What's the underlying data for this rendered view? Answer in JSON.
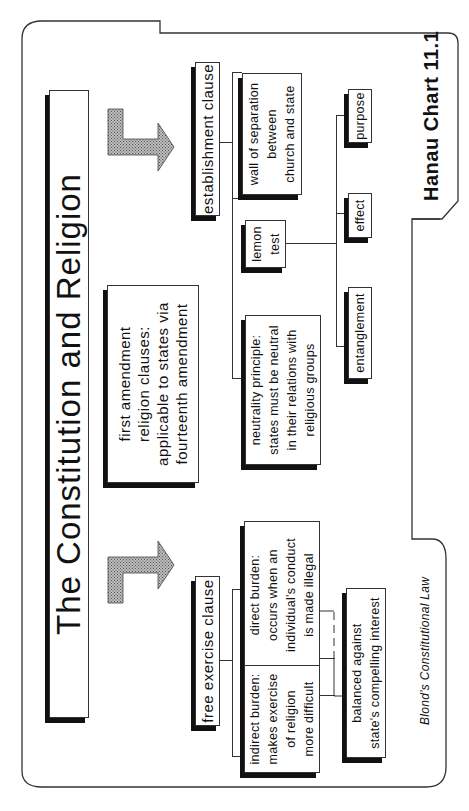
{
  "title": "The Constitution and Religion",
  "root": {
    "label": "first amendment religion clauses: applicable to states via fourteenth amendment",
    "lines": [
      "first amendment",
      "religion clauses:",
      "applicable to states via",
      "fourteenth amendment"
    ]
  },
  "establishment": {
    "label": "establishment clause",
    "wall": {
      "lines": [
        "wall of separation",
        "between",
        "church and state"
      ]
    },
    "lemon": {
      "lines": [
        "lemon",
        "test"
      ],
      "prongs": [
        "purpose",
        "effect",
        "entanglement"
      ]
    },
    "neutrality": {
      "lines": [
        "neutrality principle:",
        "states must be neutral",
        "in their relations with",
        "religious groups"
      ]
    }
  },
  "free_exercise": {
    "label": "free exercise clause",
    "direct": {
      "lines": [
        "direct burden:",
        "occurs when an",
        "individual's conduct",
        "is made illegal"
      ]
    },
    "indirect": {
      "lines": [
        "indirect burden:",
        "makes exercise",
        "of religion",
        "more difficult"
      ]
    },
    "balance": {
      "lines": [
        "balanced against",
        "state's compelling interest"
      ]
    }
  },
  "footer": {
    "chart_label": "Hanau Chart 11.1",
    "credit": "Blond's Constitutional Law"
  },
  "colors": {
    "ink": "#111111",
    "arrow_fill": "#9a9a9a",
    "background": "#ffffff"
  }
}
